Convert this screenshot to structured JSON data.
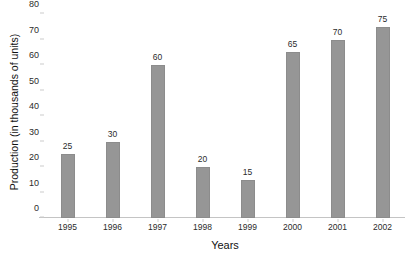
{
  "chart_data": {
    "type": "bar",
    "title": "",
    "title_sliver": "",
    "xlabel": "Years",
    "ylabel": "Production (in thousands of units)",
    "categories": [
      "1995",
      "1996",
      "1997",
      "1998",
      "1999",
      "2000",
      "2001",
      "2002"
    ],
    "values": [
      25,
      30,
      60,
      20,
      15,
      65,
      70,
      75
    ],
    "data_labels": [
      "25",
      "30",
      "60",
      "20",
      "15",
      "65",
      "70",
      "75"
    ],
    "ylim": [
      0,
      80
    ],
    "yticks": [
      0,
      10,
      20,
      30,
      40,
      50,
      60,
      70,
      80
    ],
    "ytick_labels": [
      "0",
      "10",
      "20",
      "30",
      "40",
      "50",
      "60",
      "70",
      "80"
    ],
    "grid": false,
    "legend": false,
    "bar_color": "#969696",
    "bar_border_color": "#8c8c8c",
    "axis_color": "#c4c4c4",
    "background": "#ffffff",
    "text_color": "#2b2b2b"
  }
}
